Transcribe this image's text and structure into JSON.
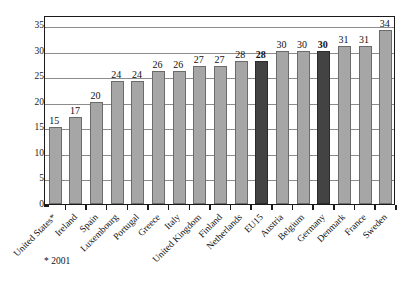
{
  "chart_data": {
    "type": "bar",
    "title": "",
    "subtitle": "",
    "xlabel": "",
    "ylabel": "",
    "ylim": [
      0,
      37
    ],
    "yticks": [
      0,
      5,
      10,
      15,
      20,
      25,
      30,
      35
    ],
    "grid": true,
    "legend": null,
    "categories": [
      "United States*",
      "Ireland",
      "Spain",
      "Luxembourg",
      "Portugal",
      "Greece",
      "Italy",
      "United Kingdom",
      "Finland",
      "Netherlands",
      "EU15",
      "Austria",
      "Belgium",
      "Germany",
      "Denmark",
      "France",
      "Sweden"
    ],
    "values": [
      15,
      17,
      20,
      24,
      24,
      26,
      26,
      27,
      27,
      28,
      28,
      30,
      30,
      30,
      31,
      31,
      34
    ],
    "data_labels": [
      "15",
      "17",
      "20",
      "24",
      "24",
      "26",
      "26",
      "27",
      "27",
      "28",
      "28",
      "30",
      "30",
      "30",
      "31",
      "31",
      "34"
    ],
    "highlighted": [
      "EU15",
      "Germany"
    ],
    "bar_color": "#a6a6a6",
    "highlight_color": "#434343",
    "annotations": [
      "* 2001"
    ]
  },
  "footnote": {
    "text": "* 2001"
  }
}
